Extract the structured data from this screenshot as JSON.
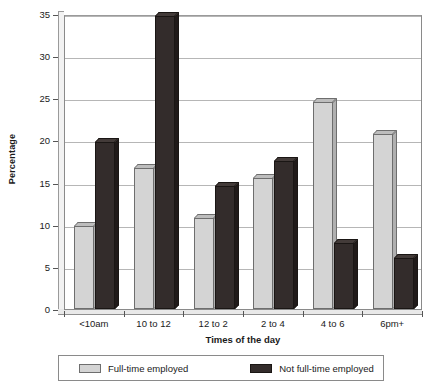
{
  "chart_data": {
    "type": "bar",
    "title": "",
    "xlabel": "Times of the day",
    "ylabel": "Percentage",
    "categories": [
      "<10am",
      "10 to 12",
      "12 to 2",
      "2 to 4",
      "4 to 6",
      "6pm+"
    ],
    "series": [
      {
        "name": "Full-time employed",
        "color": "#d4d4d4",
        "values": [
          9.8,
          16.7,
          10.8,
          15.5,
          24.6,
          20.8
        ]
      },
      {
        "name": "Not full-time employed",
        "color": "#332c2b",
        "values": [
          19.8,
          34.8,
          14.6,
          17.6,
          7.8,
          6.0
        ]
      }
    ],
    "ylim": [
      0,
      35
    ],
    "yticks": [
      0,
      5,
      10,
      15,
      20,
      25,
      30,
      35
    ],
    "ytick_labels": [
      "0",
      "5",
      "10",
      "15",
      "20",
      "25",
      "30",
      "35"
    ],
    "grid": true,
    "legend_position": "bottom"
  },
  "legend": {
    "items": [
      {
        "label": "Full-time employed"
      },
      {
        "label": "Not full-time employed"
      }
    ]
  }
}
